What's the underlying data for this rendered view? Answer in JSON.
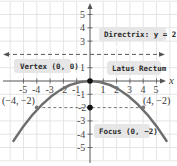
{
  "diagram": {
    "type": "parabola",
    "equation_shown": "Directrix: y = 2",
    "axes": {
      "x_label": "x",
      "x_ticks": [
        "-5",
        "-4",
        "-3",
        "-2",
        "-1",
        "1",
        "2",
        "3",
        "4",
        "5"
      ],
      "y_ticks": [
        "5",
        "4",
        "3",
        "1",
        "-1",
        "-2",
        "-3",
        "-4",
        "-5"
      ],
      "x_range": [
        -6.7,
        6.7
      ],
      "y_range": [
        -6,
        6
      ]
    },
    "callouts": {
      "directrix": "Directrix: y = 2",
      "vertex": "Vertex (0, 0)",
      "latus_rectum": "Latus Rectum",
      "focus": "Focus (0, −2)"
    },
    "points": {
      "left": "(−4, −2)",
      "right": "(4, −2)"
    },
    "colors": {
      "curve": "#6e6e6e",
      "grid": "#dcdcdc",
      "axis": "#555555",
      "dashed": "#555555",
      "callout_bg": "#e6e6e6"
    }
  }
}
